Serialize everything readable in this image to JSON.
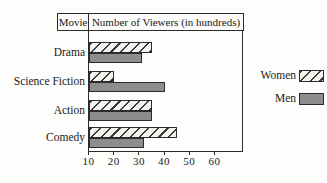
{
  "figure": {
    "header": {
      "col1": "Movie",
      "col2": "Number of Viewers (in hundreds)"
    }
  },
  "chart_data": {
    "type": "bar",
    "orientation": "horizontal",
    "title": "Number of Viewers (in hundreds)",
    "categories": [
      "Drama",
      "Science Fiction",
      "Action",
      "Comedy"
    ],
    "series": [
      {
        "name": "Women",
        "values": [
          35,
          20,
          35,
          45
        ],
        "fill": "hatched"
      },
      {
        "name": "Men",
        "values": [
          31,
          40,
          35,
          32
        ],
        "fill": "solid-gray"
      }
    ],
    "xticks": [
      10,
      20,
      30,
      40,
      50,
      60
    ],
    "xlim": [
      10,
      71
    ],
    "axis_start": 10,
    "grid": false,
    "legend_position": "right-outside",
    "colors": {
      "men_fill": "#8d8d8d",
      "hatch_line": "#3a3a3a",
      "hatch_bg": "#f4f3ef",
      "axis": "#2b2b2b",
      "text": "#1a1a1a"
    }
  }
}
